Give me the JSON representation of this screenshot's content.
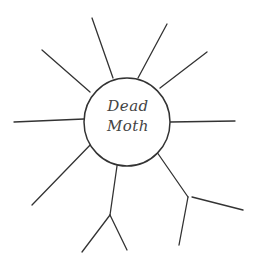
{
  "diagram": {
    "type": "spider-map",
    "center": {
      "line1": "Dead",
      "line2": "Moth"
    },
    "stroke_color": "#333333",
    "background": "#ffffff",
    "branches": [
      {
        "id": "upper-left",
        "x1": 90,
        "y1": 92,
        "x2": 42,
        "y2": 50
      },
      {
        "id": "top-left",
        "x1": 113,
        "y1": 78,
        "x2": 92,
        "y2": 18
      },
      {
        "id": "top-right",
        "x1": 138,
        "y1": 78,
        "x2": 167,
        "y2": 24
      },
      {
        "id": "right-upper",
        "x1": 160,
        "y1": 88,
        "x2": 207,
        "y2": 52
      },
      {
        "id": "left",
        "x1": 84,
        "y1": 119,
        "x2": 14,
        "y2": 122
      },
      {
        "id": "right",
        "x1": 170,
        "y1": 122,
        "x2": 235,
        "y2": 121
      },
      {
        "id": "lower-left",
        "x1": 94,
        "y1": 141,
        "x2": 32,
        "y2": 205
      },
      {
        "id": "bottom",
        "x1": 119,
        "y1": 152,
        "x2": 110,
        "y2": 215
      },
      {
        "id": "bottom-sub-left",
        "x1": 110,
        "y1": 215,
        "x2": 82,
        "y2": 252
      },
      {
        "id": "bottom-sub-right",
        "x1": 110,
        "y1": 215,
        "x2": 127,
        "y2": 250
      },
      {
        "id": "lower-right",
        "x1": 152,
        "y1": 145,
        "x2": 188,
        "y2": 197
      },
      {
        "id": "lower-right-sub-down",
        "x1": 188,
        "y1": 197,
        "x2": 179,
        "y2": 245
      },
      {
        "id": "lower-right-sub-right",
        "x1": 192,
        "y1": 197,
        "x2": 243,
        "y2": 210
      }
    ]
  }
}
